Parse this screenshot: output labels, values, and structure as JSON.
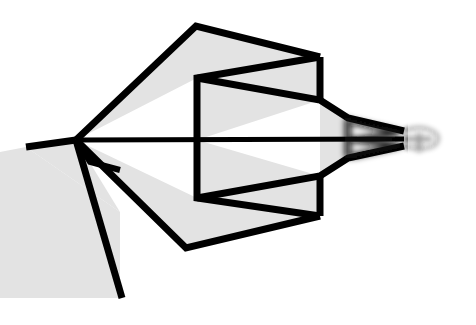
{
  "artwork": {
    "title": "Geometric Line Drawing",
    "subject": "paper-airplane-arrow-figure",
    "style": "flat line art with filled polygons",
    "canvas": {
      "width": 476,
      "height": 325,
      "background_color": "#ffffff"
    },
    "palette": {
      "background": "#ffffff",
      "fill_gray": "#e3e3e3",
      "fill_gray_dark": "#dcdcdc",
      "stroke_black": "#000000",
      "stroke_soft": "#111111"
    },
    "stroke_widths": {
      "heavy": 7,
      "medium": 5,
      "thin": 4,
      "hairline": 3
    },
    "blur": {
      "tail_blur_radius": 3.2,
      "tip_blur_radius": 2.4,
      "description": "right tail region progressively blurred / motion smeared"
    },
    "shapes": {
      "lower_left_block": {
        "name": "lower-left-gray-block",
        "points": "0,152 26,147 120,212 120,298 0,298",
        "fill": "#e3e3e3"
      },
      "upper_wing": {
        "name": "upper-wing-panel",
        "points": "76,140 196,26 320,57 197,78",
        "fill": "#e3e3e3"
      },
      "upper_inner_panel": {
        "name": "upper-inner-panel",
        "points": "197,78 320,57 320,100 197,140",
        "fill": "#e3e3e3"
      },
      "lower_wing": {
        "name": "lower-wing-panel",
        "points": "76,140 186,248 320,216 197,198",
        "fill": "#e3e3e3"
      },
      "lower_inner_panel": {
        "name": "lower-inner-panel",
        "points": "197,198 320,216 320,176 197,140",
        "fill": "#e3e3e3"
      },
      "body_fin_upper": {
        "name": "body-fin-upper",
        "points": "320,100 348,118 348,140 320,140",
        "fill": "#e3e3e3"
      },
      "body_fin_lower": {
        "name": "body-fin-lower",
        "points": "320,176 348,158 348,140 320,140",
        "fill": "#e3e3e3"
      },
      "nose_wedge": {
        "name": "nose-wedge",
        "points": "26,147 76,140 120,212",
        "fill": "#e3e3e3"
      }
    },
    "paths": {
      "upper_outer_edge": {
        "name": "upper-outer-edge-path",
        "d": "M 76,140 L 196,26 L 320,57",
        "width": 7
      },
      "upper_zigzag_return": {
        "name": "upper-zigzag-return-path",
        "d": "M 320,57 L 197,78 L 197,140",
        "width": 7
      },
      "upper_right_vertical": {
        "name": "upper-right-vertical-path",
        "d": "M 320,57 L 320,100",
        "width": 7
      },
      "upper_body_taper": {
        "name": "upper-body-taper-path",
        "d": "M 197,78 L 320,100 L 348,118 L 404,131",
        "width": 7
      },
      "lower_outer_edge": {
        "name": "lower-outer-edge-path",
        "d": "M 76,140 L 186,248 L 320,216",
        "width": 7
      },
      "lower_zigzag_return": {
        "name": "lower-zigzag-return-path",
        "d": "M 320,216 L 197,198 L 197,140",
        "width": 7
      },
      "lower_right_vertical": {
        "name": "lower-right-vertical-path",
        "d": "M 320,216 L 320,176",
        "width": 7
      },
      "lower_body_taper": {
        "name": "lower-body-taper-path",
        "d": "M 197,198 L 320,176 L 348,158 L 404,146",
        "width": 7
      },
      "center_axis": {
        "name": "center-axis-line",
        "d": "M 76,140 L 404,139",
        "width": 5
      },
      "nose_upper": {
        "name": "nose-upper-edge-path",
        "d": "M 26,147 L 76,140",
        "width": 7
      },
      "nose_lower": {
        "name": "nose-lower-edge-path",
        "d": "M 76,140 L 122,298",
        "width": 7
      },
      "nose_inner": {
        "name": "nose-inner-edge-path",
        "d": "M 76,140 L 90,162 L 120,170",
        "width": 6
      },
      "tail_fin_upper": {
        "name": "tail-fin-upper-path",
        "d": "M 348,118 L 348,140",
        "width": 6
      },
      "tail_fin_lower": {
        "name": "tail-fin-lower-path",
        "d": "M 348,158 L 348,140",
        "width": 6
      },
      "tail_chevron_upper": {
        "name": "tail-chevron-upper-path",
        "d": "M 352,122 L 400,133 L 352,140",
        "width": 5
      },
      "tail_chevron_lower": {
        "name": "tail-chevron-lower-path",
        "d": "M 352,156 L 400,145 L 352,140",
        "width": 5
      },
      "tail_tip_loop": {
        "name": "tail-tip-loop-path",
        "d": "M 404,131 C 420,124 440,130 438,140 C 436,150 416,150 404,146",
        "width": 3
      },
      "tail_tip_cross": {
        "name": "tail-tip-crossbar-path",
        "d": "M 419,133 L 419,152",
        "width": 5
      },
      "tail_tip_stub": {
        "name": "tail-tip-stub-path",
        "d": "M 404,139 L 432,139",
        "width": 5
      }
    }
  }
}
